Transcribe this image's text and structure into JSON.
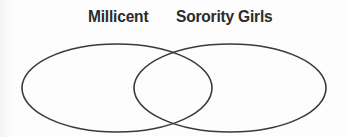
{
  "figure": {
    "type": "venn-diagram",
    "width": 346,
    "height": 137,
    "background_color": "#fdfdfd",
    "stroke_color": "#3a3a3a",
    "stroke_width": 1.6,
    "text_color": "#2b2b2b"
  },
  "labels": {
    "left": "Millicent",
    "right": "Sorority Girls"
  },
  "chart_data": {
    "type": "venn",
    "title": "",
    "sets": [
      {
        "name": "Millicent",
        "label": "Millicent",
        "shape": "ellipse",
        "cx": 117,
        "cy": 88,
        "rx": 95,
        "ry": 44,
        "label_x": 88,
        "label_y": 7,
        "fill": "none",
        "stroke": "#3a3a3a"
      },
      {
        "name": "Sorority Girls",
        "label": "Sorority Girls",
        "shape": "ellipse",
        "cx": 230,
        "cy": 88,
        "rx": 96,
        "ry": 44,
        "label_x": 176,
        "label_y": 7,
        "fill": "none",
        "stroke": "#3a3a3a"
      }
    ],
    "intersection": {
      "label": "",
      "upper_crossing": [
        173,
        52
      ],
      "lower_crossing": [
        173,
        125
      ]
    },
    "region_values": [],
    "legend": "none",
    "grid": false
  }
}
